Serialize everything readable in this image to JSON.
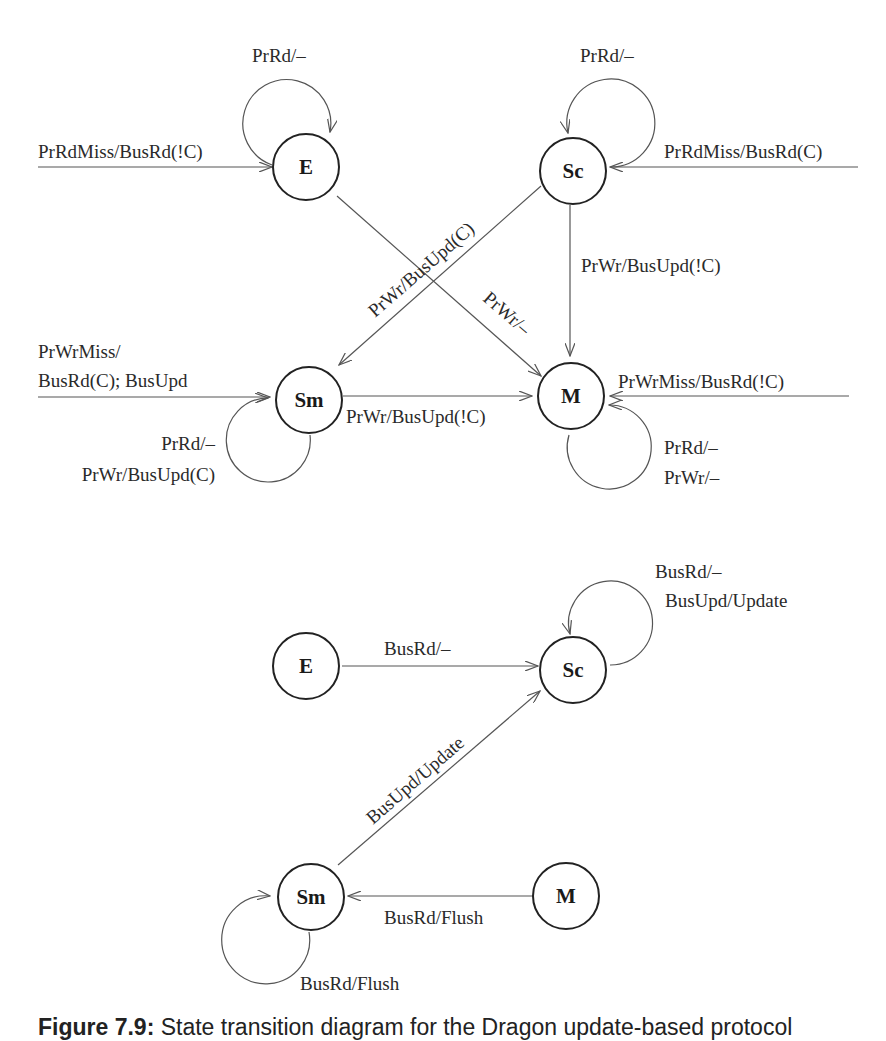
{
  "diagram_top": {
    "title": "Processor-initiated transitions",
    "states": {
      "E": "E",
      "Sc": "Sc",
      "Sm": "Sm",
      "M": "M"
    },
    "edges": {
      "e_self": "PrRd/–",
      "e_in": "PrRdMiss/BusRd(!C)",
      "sc_self": "PrRd/–",
      "sc_in": "PrRdMiss/BusRd(C)",
      "sc_to_sm": "PrWr/BusUpd(C)",
      "sc_to_m": "PrWr/BusUpd(!C)",
      "e_to_m": "PrWr/–",
      "sm_in_line1": "PrWrMiss/",
      "sm_in_line2": "BusRd(C); BusUpd",
      "sm_to_m": "PrWr/BusUpd(!C)",
      "sm_self_line1": "PrRd/–",
      "sm_self_line2": "PrWr/BusUpd(C)",
      "m_in": "PrWrMiss/BusRd(!C)",
      "m_self_line1": "PrRd/–",
      "m_self_line2": "PrWr/–"
    }
  },
  "diagram_bottom": {
    "title": "Bus-initiated transitions",
    "states": {
      "E": "E",
      "Sc": "Sc",
      "Sm": "Sm",
      "M": "M"
    },
    "edges": {
      "sc_self_line1": "BusRd/–",
      "sc_self_line2": "BusUpd/Update",
      "e_to_sc": "BusRd/–",
      "sm_to_sc": "BusUpd/Update",
      "m_to_sm": "BusRd/Flush",
      "sm_self": "BusRd/Flush"
    }
  },
  "caption": {
    "figure": "Figure 7.9:",
    "text": "State transition diagram for the Dragon update-based protocol"
  }
}
